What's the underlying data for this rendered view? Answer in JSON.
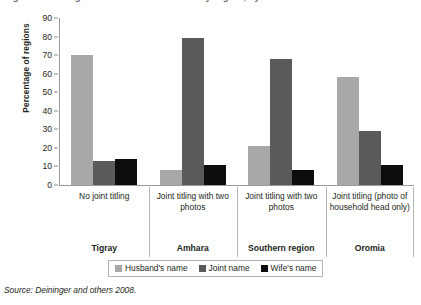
{
  "title": {
    "text": "Figure: Land registration and certification by region, by whose name land is titled",
    "cropped": true
  },
  "source": {
    "label": "Source: Deininger and others 2008."
  },
  "legend": {
    "position": "bottom-center",
    "items": [
      {
        "label": "Husband's name",
        "color": "#a8a8a8",
        "key": "husband"
      },
      {
        "label": "Joint name",
        "color": "#5a5a5a",
        "key": "joint"
      },
      {
        "label": "Wife's name",
        "color": "#0d0d0d",
        "key": "wife"
      }
    ]
  },
  "axes": {
    "ylabel": "Percentage of regions",
    "yticks": [
      "0",
      "10",
      "20",
      "30",
      "40",
      "50",
      "60",
      "70",
      "80",
      "90"
    ],
    "ymin": 0,
    "ymax": 90
  },
  "categories": [
    {
      "title": "No joint titling",
      "region": "Tigray"
    },
    {
      "title": "Joint titling with two photos",
      "region": "Amhara"
    },
    {
      "title": "Joint titling with two photos",
      "region": "Southern region"
    },
    {
      "title": "Joint titling (photo of household head only)",
      "region": "Oromia"
    }
  ],
  "chart_data": {
    "type": "bar",
    "title": "Figure: Land registration and certification by region, by whose name land is titled",
    "xlabel": "",
    "ylabel": "Percentage of regions",
    "ylim": [
      0,
      90
    ],
    "ytick_step": 10,
    "grid": false,
    "legend_position": "bottom-center",
    "categories": [
      "No joint titling (Tigray)",
      "Joint titling with two photos (Amhara)",
      "Joint titling with two photos (Southern region)",
      "Joint titling (photo of household head only) (Oromia)"
    ],
    "regions": [
      "Tigray",
      "Amhara",
      "Southern region",
      "Oromia"
    ],
    "series": [
      {
        "name": "Husband's name",
        "color": "#a8a8a8",
        "values": [
          70,
          8,
          21,
          58
        ]
      },
      {
        "name": "Joint name",
        "color": "#5a5a5a",
        "values": [
          13,
          79,
          68,
          29
        ]
      },
      {
        "name": "Wife's name",
        "color": "#0d0d0d",
        "values": [
          14,
          11,
          8,
          11
        ]
      }
    ],
    "source": "Source: Deininger and others 2008."
  }
}
